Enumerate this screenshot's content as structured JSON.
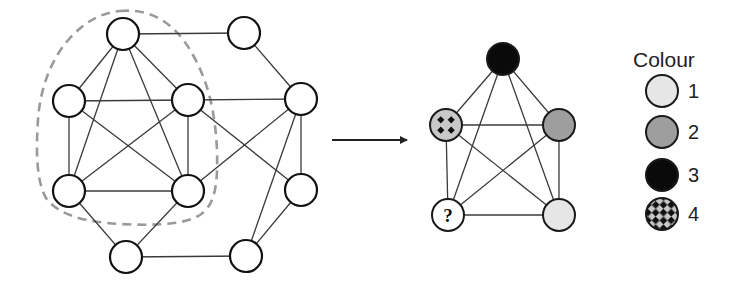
{
  "left_graph": {
    "nodes": [
      {
        "id": "A",
        "x": 123,
        "y": 34
      },
      {
        "id": "B",
        "x": 244,
        "y": 33
      },
      {
        "id": "C",
        "x": 69,
        "y": 101
      },
      {
        "id": "D",
        "x": 188,
        "y": 100
      },
      {
        "id": "E",
        "x": 301,
        "y": 99
      },
      {
        "id": "F",
        "x": 69,
        "y": 191
      },
      {
        "id": "G",
        "x": 188,
        "y": 191
      },
      {
        "id": "H",
        "x": 301,
        "y": 190
      },
      {
        "id": "I",
        "x": 126,
        "y": 257
      },
      {
        "id": "J",
        "x": 246,
        "y": 256
      }
    ],
    "edges": [
      [
        "A",
        "B"
      ],
      [
        "A",
        "C"
      ],
      [
        "A",
        "D"
      ],
      [
        "A",
        "F"
      ],
      [
        "A",
        "G"
      ],
      [
        "B",
        "E"
      ],
      [
        "C",
        "D"
      ],
      [
        "C",
        "F"
      ],
      [
        "C",
        "G"
      ],
      [
        "D",
        "E"
      ],
      [
        "D",
        "F"
      ],
      [
        "D",
        "G"
      ],
      [
        "D",
        "H"
      ],
      [
        "E",
        "G"
      ],
      [
        "E",
        "H"
      ],
      [
        "E",
        "J"
      ],
      [
        "F",
        "G"
      ],
      [
        "F",
        "I"
      ],
      [
        "G",
        "I"
      ],
      [
        "H",
        "J"
      ],
      [
        "I",
        "J"
      ]
    ],
    "node_radius": 16,
    "highlight_outline": {
      "style": "dashed",
      "color": "#9a9a9a",
      "encloses": [
        "A",
        "C",
        "D",
        "F",
        "G"
      ]
    }
  },
  "arrow": {
    "x1": 332,
    "y1": 140,
    "x2": 407,
    "y2": 140,
    "color": "#222222"
  },
  "right_graph": {
    "nodes": [
      {
        "id": "T",
        "x": 503,
        "y": 59,
        "colour": 3
      },
      {
        "id": "L",
        "x": 446,
        "y": 125,
        "colour": 4
      },
      {
        "id": "R",
        "x": 559,
        "y": 125,
        "colour": 2
      },
      {
        "id": "BL",
        "x": 448,
        "y": 215,
        "colour": null,
        "label": "?"
      },
      {
        "id": "BR",
        "x": 559,
        "y": 215,
        "colour": 1
      }
    ],
    "edges": [
      [
        "T",
        "L"
      ],
      [
        "T",
        "R"
      ],
      [
        "T",
        "BL"
      ],
      [
        "T",
        "BR"
      ],
      [
        "L",
        "R"
      ],
      [
        "L",
        "BL"
      ],
      [
        "L",
        "BR"
      ],
      [
        "R",
        "BL"
      ],
      [
        "R",
        "BR"
      ],
      [
        "BL",
        "BR"
      ]
    ],
    "node_radius": 16,
    "unknown_label": "?"
  },
  "legend": {
    "title": "Colour",
    "items": [
      {
        "label": "1",
        "colour_id": 1,
        "fill": "#e6e6e6",
        "pattern": "solid"
      },
      {
        "label": "2",
        "colour_id": 2,
        "fill": "#9e9e9e",
        "pattern": "solid"
      },
      {
        "label": "3",
        "colour_id": 3,
        "fill": "#0a0a0a",
        "pattern": "solid"
      },
      {
        "label": "4",
        "colour_id": 4,
        "fill": "#c8c8c8",
        "pattern": "checker"
      }
    ]
  }
}
